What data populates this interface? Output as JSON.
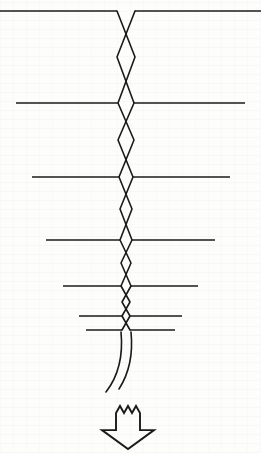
{
  "figure": {
    "caption": "",
    "background_color": "#fdfdfc",
    "line_color": "#1a1a1a",
    "canvas": {
      "width": 261,
      "height": 453
    }
  },
  "geometry": {
    "center_x": 126,
    "cross_members": [
      {
        "id": "cross-member-1",
        "y": 11,
        "x1": 0,
        "x2": 261
      },
      {
        "id": "cross-member-2",
        "y": 103,
        "x1": 16,
        "x2": 245
      },
      {
        "id": "cross-member-3",
        "y": 177,
        "x1": 32,
        "x2": 230
      },
      {
        "id": "cross-member-4",
        "y": 240,
        "x1": 46,
        "x2": 215
      },
      {
        "id": "cross-member-5",
        "y": 286,
        "x1": 63,
        "x2": 198
      },
      {
        "id": "cross-member-6",
        "y": 316,
        "x1": 79,
        "x2": 182
      },
      {
        "id": "cross-member-7",
        "y": 330,
        "x1": 86,
        "x2": 175
      }
    ],
    "braid": {
      "crossing_nodes_y": [
        11,
        57,
        103,
        140,
        177,
        209,
        240,
        263,
        286,
        302,
        316,
        330
      ],
      "lens_half_widths": [
        9,
        9,
        8,
        8,
        7,
        6,
        6,
        5,
        5,
        4,
        4
      ],
      "strand_count": 2
    },
    "tails": [
      {
        "id": "tail-left",
        "start": [
          121,
          332
        ],
        "end": [
          106,
          392
        ]
      },
      {
        "id": "tail-right",
        "start": [
          131,
          332
        ],
        "end": [
          119,
          389
        ]
      }
    ]
  },
  "arrow": {
    "name": "downward-direction-arrow",
    "label": "",
    "center_x": 128,
    "top_y": 406,
    "bottom_y": 449,
    "shaft_half_width": 12,
    "head_half_width": 26,
    "jagged_peaks": 3,
    "jag_depth": 7,
    "fill": "none",
    "stroke": "#1a1a1a"
  },
  "labels": {
    "figure_number": "",
    "annotations": []
  }
}
